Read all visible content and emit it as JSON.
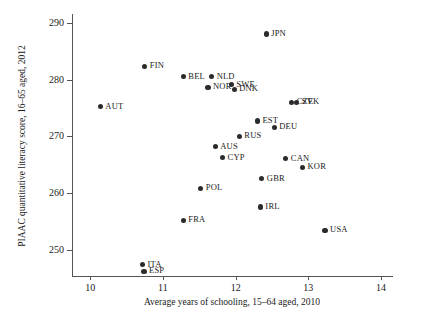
{
  "chart_data": {
    "type": "scatter",
    "title": "",
    "xlabel": "Average years of schooling, 15–64 aged, 2010",
    "ylabel": "PIAAC quantitative literacy score, 16–65 aged, 2012",
    "xlim": [
      9.75,
      14.15
    ],
    "ylim": [
      245.5,
      291.5
    ],
    "xticks": [
      10,
      11,
      12,
      13,
      14
    ],
    "yticks": [
      250,
      260,
      270,
      280,
      290
    ],
    "xtick_labels": [
      "10",
      "11",
      "12",
      "13",
      "14"
    ],
    "ytick_labels": [
      "250",
      "260",
      "270",
      "280",
      "290"
    ],
    "grid": false,
    "legend": false,
    "marker_color": "#2b2b2b",
    "axis_color": "#555555",
    "points": [
      {
        "label": "JPN",
        "x": 12.42,
        "y": 288.0,
        "label_pos": "right"
      },
      {
        "label": "FIN",
        "x": 10.75,
        "y": 282.3,
        "label_pos": "right"
      },
      {
        "label": "BEL",
        "x": 11.28,
        "y": 280.5,
        "label_pos": "right"
      },
      {
        "label": "NLD",
        "x": 11.67,
        "y": 280.5,
        "label_pos": "right"
      },
      {
        "label": "NOR",
        "x": 11.62,
        "y": 278.6,
        "label_pos": "right"
      },
      {
        "label": "SWE",
        "x": 11.94,
        "y": 279.1,
        "label_pos": "right"
      },
      {
        "label": "DNK",
        "x": 11.98,
        "y": 278.3,
        "label_pos": "right"
      },
      {
        "label": "CZE",
        "x": 12.77,
        "y": 276.0,
        "label_pos": "right"
      },
      {
        "label": "SVK",
        "x": 12.84,
        "y": 276.0,
        "label_pos": "right"
      },
      {
        "label": "AUT",
        "x": 10.14,
        "y": 275.2,
        "label_pos": "right"
      },
      {
        "label": "EST",
        "x": 12.3,
        "y": 272.7,
        "label_pos": "right"
      },
      {
        "label": "DEU",
        "x": 12.53,
        "y": 271.6,
        "label_pos": "right"
      },
      {
        "label": "RUS",
        "x": 12.05,
        "y": 270.0,
        "label_pos": "right"
      },
      {
        "label": "AUS",
        "x": 11.72,
        "y": 268.2,
        "label_pos": "right"
      },
      {
        "label": "CYP",
        "x": 11.82,
        "y": 266.3,
        "label_pos": "right"
      },
      {
        "label": "CAN",
        "x": 12.69,
        "y": 266.1,
        "label_pos": "right"
      },
      {
        "label": "KOR",
        "x": 12.92,
        "y": 264.6,
        "label_pos": "right"
      },
      {
        "label": "GBR",
        "x": 12.36,
        "y": 262.6,
        "label_pos": "right"
      },
      {
        "label": "POL",
        "x": 11.52,
        "y": 260.9,
        "label_pos": "right"
      },
      {
        "label": "IRL",
        "x": 12.34,
        "y": 257.6,
        "label_pos": "right"
      },
      {
        "label": "USA",
        "x": 13.23,
        "y": 253.5,
        "label_pos": "right"
      },
      {
        "label": "FRA",
        "x": 11.28,
        "y": 255.3,
        "label_pos": "right"
      },
      {
        "label": "ITA",
        "x": 10.72,
        "y": 247.5,
        "label_pos": "right"
      },
      {
        "label": "ESP",
        "x": 10.74,
        "y": 246.3,
        "label_pos": "right"
      }
    ]
  }
}
